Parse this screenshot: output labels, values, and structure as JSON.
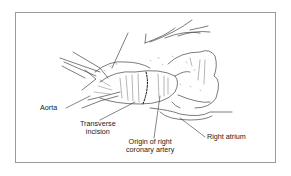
{
  "figure": {
    "border_color": "#9a9a9a",
    "line_color": "#444444",
    "labels": {
      "aorta": "Aorta",
      "transverse_incision_line1": "Transverse",
      "transverse_incision_line2": "incision",
      "rca_origin_line1": "Origin of right",
      "rca_origin_line2": "coronary artery",
      "right_atrium": "Right atrium"
    }
  }
}
